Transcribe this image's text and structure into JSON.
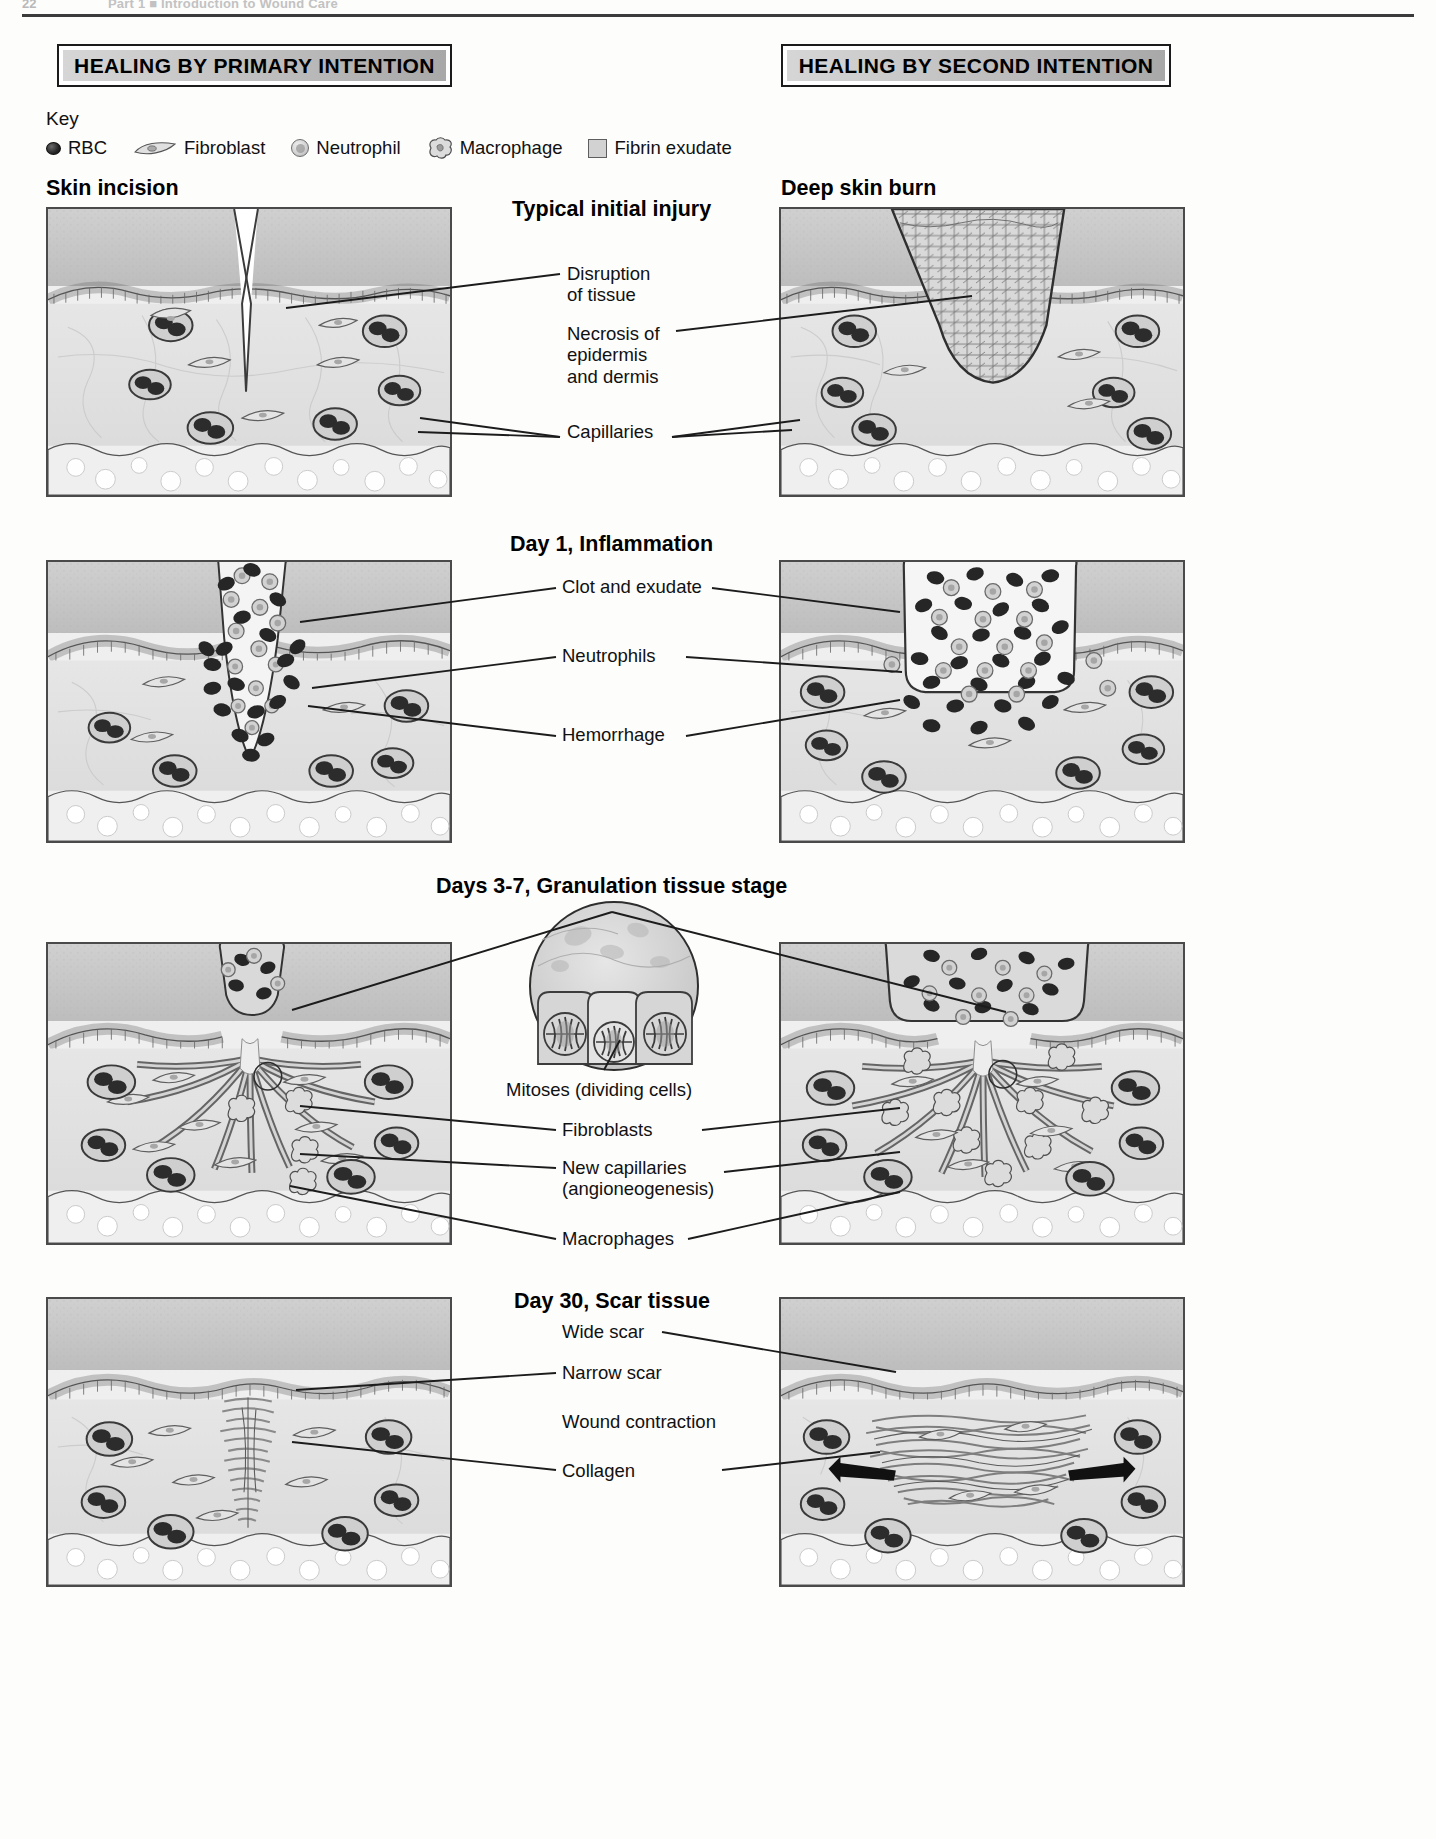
{
  "page_header": {
    "folio": "22",
    "running_head": "Part 1  ■  Introduction to Wound Care"
  },
  "banners": {
    "left": "HEALING BY PRIMARY INTENTION",
    "right": "HEALING BY SECOND INTENTION"
  },
  "key": {
    "title": "Key",
    "items": [
      {
        "icon": "rbc-icon",
        "label": "RBC"
      },
      {
        "icon": "fibroblast-icon",
        "label": "Fibroblast"
      },
      {
        "icon": "neutrophil-icon",
        "label": "Neutrophil"
      },
      {
        "icon": "macrophage-icon",
        "label": "Macrophage"
      },
      {
        "icon": "fibrin-exudate-icon",
        "label": "Fibrin exudate"
      }
    ]
  },
  "columns": {
    "left_caption": "Skin incision",
    "right_caption": "Deep skin burn"
  },
  "rows": [
    {
      "heading": "Typical initial injury",
      "callouts": [
        {
          "text": "Disruption\nof tissue"
        },
        {
          "text": "Necrosis of\nepidermis\nand dermis"
        },
        {
          "text": "Capillaries"
        }
      ]
    },
    {
      "heading": "Day 1, Inflammation",
      "callouts": [
        {
          "text": "Clot and exudate"
        },
        {
          "text": "Neutrophils"
        },
        {
          "text": "Hemorrhage"
        }
      ]
    },
    {
      "heading": "Days 3-7, Granulation tissue stage",
      "callouts": [
        {
          "text": "Mitoses (dividing cells)"
        },
        {
          "text": "Fibroblasts"
        },
        {
          "text": "New capillaries\n(angioneogenesis)"
        },
        {
          "text": "Macrophages"
        }
      ]
    },
    {
      "heading": "Day 30, Scar tissue",
      "callouts": [
        {
          "text": "Wide scar"
        },
        {
          "text": "Narrow scar"
        },
        {
          "text": "Wound contraction"
        },
        {
          "text": "Collagen"
        }
      ]
    }
  ],
  "colors": {
    "banner_gradient_start": "#d6d6d6",
    "banner_gradient_end": "#a8a8a8",
    "epidermis": "#c9c9c9",
    "dermis": "#e3e3e3",
    "subcutis": "#ececec",
    "rbc_fill": "#2a2a2a",
    "neutrophil_fill": "#cfcfcf",
    "ink": "#111111",
    "panel_border": "#4a4a4a"
  }
}
